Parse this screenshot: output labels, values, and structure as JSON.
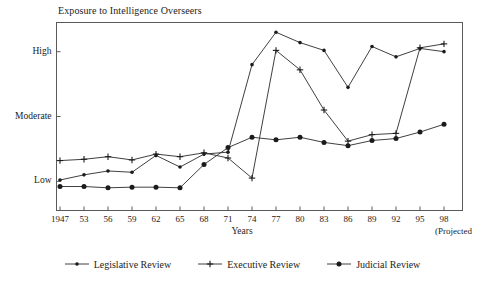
{
  "chart_data": {
    "type": "line",
    "title": "Exposure to Intelligence Overseers",
    "xlabel": "Years",
    "ylabel": "",
    "note": "(Projected",
    "grid": false,
    "legend_position": "bottom",
    "categories": [
      "1947",
      "53",
      "56",
      "59",
      "62",
      "65",
      "68",
      "71",
      "74",
      "77",
      "80",
      "83",
      "86",
      "89",
      "92",
      "95",
      "98"
    ],
    "y_ticks": [
      {
        "label": "Low",
        "value": 1
      },
      {
        "label": "Moderate",
        "value": 2
      },
      {
        "label": "High",
        "value": 3
      }
    ],
    "ylim": [
      0.55,
      3.45
    ],
    "series": [
      {
        "name": "Legislative Review",
        "marker": "small-dot",
        "values": [
          1.02,
          1.1,
          1.16,
          1.14,
          1.4,
          1.22,
          1.42,
          1.45,
          2.8,
          3.3,
          3.14,
          3.02,
          2.45,
          3.08,
          2.92,
          3.05,
          3.0
        ]
      },
      {
        "name": "Executive Review",
        "marker": "plus",
        "values": [
          1.32,
          1.34,
          1.38,
          1.33,
          1.42,
          1.38,
          1.44,
          1.36,
          1.05,
          3.02,
          2.72,
          2.1,
          1.62,
          1.72,
          1.74,
          3.06,
          3.12
        ]
      },
      {
        "name": "Judicial Review",
        "marker": "large-dot",
        "values": [
          0.92,
          0.92,
          0.9,
          0.91,
          0.91,
          0.9,
          1.26,
          1.52,
          1.68,
          1.64,
          1.68,
          1.6,
          1.55,
          1.63,
          1.66,
          1.76,
          1.88
        ]
      }
    ]
  },
  "colors": {
    "ink": "#1b1b1b",
    "line": "#2a2a2a",
    "frame": "#555555",
    "background": "#ffffff"
  }
}
